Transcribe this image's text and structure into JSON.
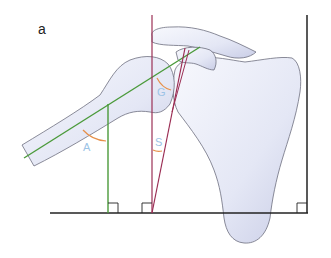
{
  "figure": {
    "panel_label": "a",
    "angles": [
      {
        "id": "A",
        "label": "A",
        "x": 83,
        "y": 141
      },
      {
        "id": "G",
        "label": "G",
        "x": 157,
        "y": 86
      },
      {
        "id": "S",
        "label": "S",
        "x": 155,
        "y": 136
      }
    ],
    "colors": {
      "bone_fill": "#eef0fa",
      "bone_outline": "#6d6f7f",
      "humeral_axis": "#4a9a3a",
      "glenoid_lines": "#9b2f55",
      "baseline": "#222222",
      "angle_arc": "#e6904a",
      "angle_label": "#9cc3e6"
    }
  }
}
